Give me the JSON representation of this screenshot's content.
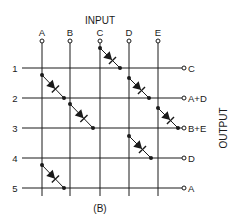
{
  "diagram": {
    "input_label": "INPUT",
    "output_label": "OUTPUT",
    "caption": "(B)",
    "colors": {
      "ink": "#1a1a1a",
      "background": "#ffffff"
    },
    "columns": [
      {
        "id": "A",
        "label": "A",
        "x": 42
      },
      {
        "id": "B",
        "label": "B",
        "x": 70
      },
      {
        "id": "C",
        "label": "C",
        "x": 100
      },
      {
        "id": "D",
        "label": "D",
        "x": 129
      },
      {
        "id": "E",
        "label": "E",
        "x": 158
      }
    ],
    "rows": [
      {
        "id": "1",
        "label": "1",
        "y": 68,
        "output": "C"
      },
      {
        "id": "2",
        "label": "2",
        "y": 98,
        "output": "A+D"
      },
      {
        "id": "3",
        "label": "3",
        "y": 128,
        "output": "B+E"
      },
      {
        "id": "4",
        "label": "4",
        "y": 158,
        "output": "D"
      },
      {
        "id": "5",
        "label": "5",
        "y": 188,
        "output": "A"
      }
    ],
    "diodes": [
      {
        "from_column": "C",
        "to_row": "1"
      },
      {
        "from_column": "A",
        "to_row": "2"
      },
      {
        "from_column": "D",
        "to_row": "2"
      },
      {
        "from_column": "B",
        "to_row": "3"
      },
      {
        "from_column": "E",
        "to_row": "3"
      },
      {
        "from_column": "D",
        "to_row": "4"
      },
      {
        "from_column": "A",
        "to_row": "5"
      }
    ]
  }
}
